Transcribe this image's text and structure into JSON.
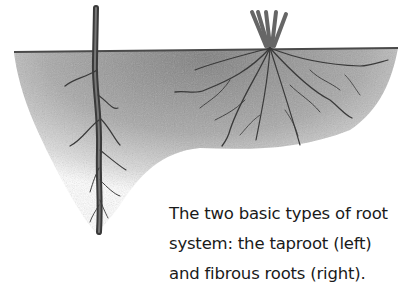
{
  "illustration": {
    "subject": "taproot and fibrous root systems in soil",
    "colors": {
      "soil": "#9a9a9a",
      "root": "#3a3a3a",
      "background": "#ffffff"
    }
  },
  "caption": {
    "lines": [
      "The two basic types of root",
      "system: the taproot (left)",
      "and fibrous roots (right)."
    ]
  }
}
